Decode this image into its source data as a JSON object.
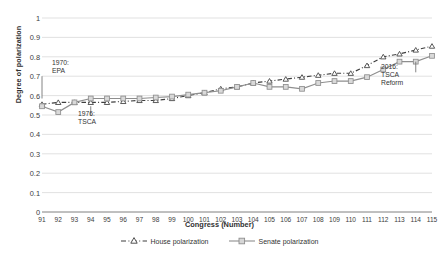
{
  "chart_data": {
    "type": "line",
    "title": "",
    "xlabel": "Congress (Number)",
    "ylabel": "Degree of polarization",
    "xlim": [
      91,
      115
    ],
    "ylim": [
      0,
      1
    ],
    "ytick_step": 0.1,
    "grid": true,
    "legend_position": "bottom",
    "categories": [
      91,
      92,
      93,
      94,
      95,
      96,
      97,
      98,
      99,
      100,
      101,
      102,
      103,
      104,
      105,
      106,
      107,
      108,
      109,
      110,
      111,
      112,
      113,
      114,
      115
    ],
    "series": [
      {
        "name": "House polarization",
        "color": "#3f3f3f",
        "style": "dashed",
        "marker": "open-triangle",
        "values": [
          0.555,
          0.565,
          0.565,
          0.565,
          0.565,
          0.57,
          0.575,
          0.575,
          0.585,
          0.6,
          0.615,
          0.635,
          0.645,
          0.665,
          0.675,
          0.685,
          0.695,
          0.705,
          0.715,
          0.715,
          0.755,
          0.8,
          0.815,
          0.835,
          0.855
        ]
      },
      {
        "name": "Senate polarization",
        "color": "#8e8e8e",
        "style": "solid",
        "marker": "square",
        "values": [
          0.545,
          0.515,
          0.565,
          0.585,
          0.585,
          0.585,
          0.585,
          0.59,
          0.595,
          0.605,
          0.615,
          0.625,
          0.645,
          0.665,
          0.645,
          0.645,
          0.635,
          0.665,
          0.675,
          0.675,
          0.695,
          0.735,
          0.775,
          0.775,
          0.805
        ]
      }
    ],
    "ytick_labels": [
      "1",
      "0.9",
      "0.8",
      "0.7",
      "0.6",
      "0.5",
      "0.4",
      "0.3",
      "0.2",
      "0.1",
      "0"
    ],
    "ytick_values": [
      1,
      0.9,
      0.8,
      0.7,
      0.6,
      0.5,
      0.4,
      0.3,
      0.2,
      0.1,
      0
    ],
    "xtick_labels": [
      "91",
      "92",
      "93",
      "94",
      "95",
      "96",
      "97",
      "98",
      "99",
      "100",
      "101",
      "102",
      "103",
      "104",
      "105",
      "106",
      "107",
      "108",
      "109",
      "110",
      "111",
      "112",
      "113",
      "114",
      "115"
    ],
    "annotations": [
      {
        "id": "epa",
        "text": "1970:\nEPA",
        "x_congress": 91,
        "pointer_from": 0.7,
        "pointer_to": 0.585,
        "label_x": 52,
        "label_y": 59
      },
      {
        "id": "tsca",
        "text": "1976:\nTSCA",
        "x_congress": 94,
        "pointer_from": 0.545,
        "pointer_to": 0.5,
        "label_x": 78,
        "label_y": 110
      },
      {
        "id": "tsca-reform",
        "text": "2016:\nTSCA\nReform",
        "x_congress": 114,
        "pointer_from": 0.775,
        "pointer_to": 0.72,
        "label_x": 381,
        "label_y": 63
      }
    ]
  },
  "legend": {
    "items": [
      {
        "label": "House polarization"
      },
      {
        "label": "Senate polarization"
      }
    ]
  }
}
